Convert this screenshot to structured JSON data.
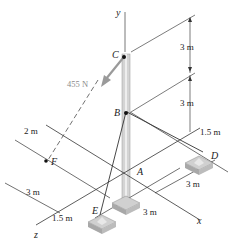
{
  "figure": {
    "axes": {
      "x": "x",
      "y": "y",
      "z": "z"
    },
    "points": {
      "A": "A",
      "B": "B",
      "C": "C",
      "D": "D",
      "E": "E",
      "F": "F"
    },
    "force": {
      "label": "455 N",
      "from": "C",
      "direction": "toward F"
    },
    "dimensions": {
      "BC": "3 m",
      "AB": "3 m",
      "D_offset_x": "1.5 m",
      "F_offset": "2 m",
      "F_z": "3 m",
      "E_x": "1.5 m",
      "E_to_D_along_x": "3 m",
      "D_z": "3 m"
    },
    "colors": {
      "line": "#333333",
      "pole": "#c8c8c8",
      "force_arrow": "#9a9a9a",
      "footing": "#bdbdbd"
    }
  }
}
